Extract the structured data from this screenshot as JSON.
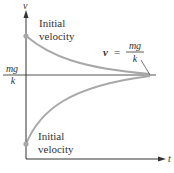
{
  "diagram": {
    "axes": {
      "y_label": "v",
      "x_label": "t"
    },
    "asymptote_label_left": {
      "numerator": "mg",
      "denominator": "k"
    },
    "equation_label": {
      "lhs": "v",
      "equals": "=",
      "numerator": "mg",
      "denominator": "k"
    },
    "upper_annotation": {
      "line1": "Initial",
      "line2": "velocity"
    },
    "lower_annotation": {
      "line1": "Initial",
      "line2": "velocity"
    },
    "colors": {
      "axis": "#333333",
      "curve": "#a8a8a8",
      "point": "#a8a8a8",
      "asymptote": "#555555"
    }
  }
}
